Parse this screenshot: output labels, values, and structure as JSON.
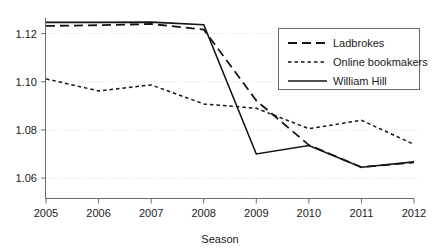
{
  "chart_data": {
    "type": "line",
    "title": "",
    "subtitle": "",
    "xlabel": "Season",
    "ylabel": "",
    "x": [
      2005,
      2006,
      2007,
      2008,
      2009,
      2010,
      2011,
      2012
    ],
    "categories": [
      "2005",
      "2006",
      "2007",
      "2008",
      "2009",
      "2010",
      "2011",
      "2012"
    ],
    "xlim": [
      2005,
      2012
    ],
    "ylim": [
      1.0515,
      1.1265
    ],
    "yticks": [
      1.06,
      1.08,
      1.1,
      1.12
    ],
    "ytick_labels": [
      "1.06",
      "1.08",
      "1.10",
      "1.12"
    ],
    "xticks": [
      2005,
      2006,
      2007,
      2008,
      2009,
      2010,
      2011,
      2012
    ],
    "xtick_labels": [
      "2005",
      "2006",
      "2007",
      "2008",
      "2009",
      "2010",
      "2011",
      "2012"
    ],
    "grid": "horizontal-dotted",
    "legend_position": "upper-right-inside",
    "series": [
      {
        "name": "Ladbrokes",
        "style": "long-dashed",
        "dash": "9 5",
        "width": 1.8,
        "values": [
          1.1232,
          1.1235,
          1.124,
          1.1217,
          1.0922,
          1.0737,
          1.0645,
          1.0665
        ]
      },
      {
        "name": "Online bookmakers",
        "style": "short-dashed",
        "dash": "3.5 3",
        "width": 1.5,
        "values": [
          1.1012,
          1.0962,
          1.0987,
          1.0908,
          1.089,
          1.0805,
          1.084,
          1.074
        ]
      },
      {
        "name": "William Hill",
        "style": "solid",
        "dash": "none",
        "width": 1.6,
        "values": [
          1.1247,
          1.1247,
          1.1248,
          1.1237,
          1.07,
          1.0735,
          1.0645,
          1.0667
        ]
      }
    ]
  },
  "legend": {
    "entries": [
      {
        "label": "Ladbrokes"
      },
      {
        "label": "Online bookmakers"
      },
      {
        "label": "William Hill"
      }
    ]
  },
  "axes": {
    "x_title": "Season"
  },
  "colors": {
    "line": "#141414",
    "grid": "#cfcfcf",
    "axis": "#6b6b6b",
    "text": "#1a1a1a",
    "background": "#ffffff"
  }
}
